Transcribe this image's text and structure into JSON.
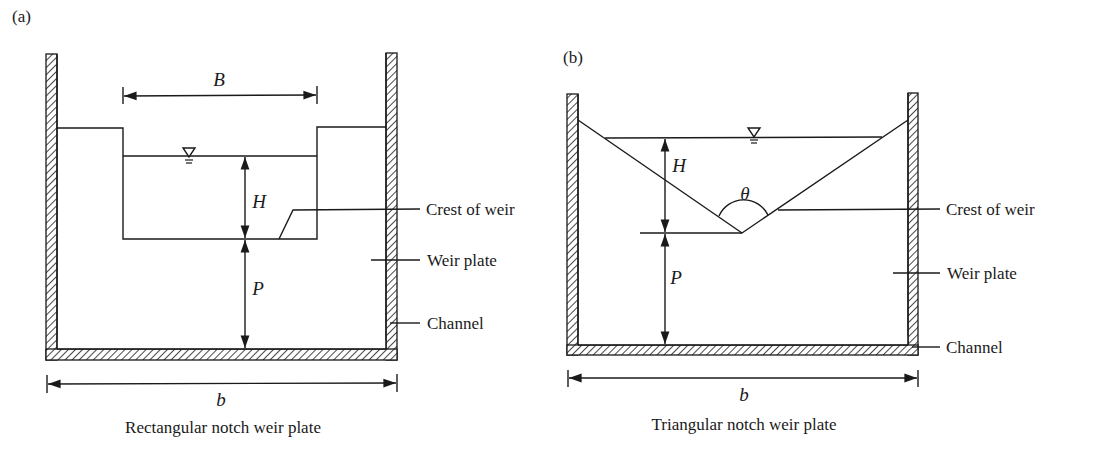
{
  "panels": [
    {
      "id": "a",
      "tag": "(a)",
      "caption": "Rectangular notch weir plate",
      "dimensions": {
        "notch_width": "B",
        "head": "H",
        "crest_height": "P",
        "channel_width": "b"
      },
      "callouts": {
        "crest": "Crest of weir",
        "plate": "Weir plate",
        "channel": "Channel"
      }
    },
    {
      "id": "b",
      "tag": "(b)",
      "caption": "Triangular notch weir plate",
      "dimensions": {
        "angle": "θ",
        "head": "H",
        "crest_height": "P",
        "channel_width": "b"
      },
      "callouts": {
        "crest": "Crest of weir",
        "plate": "Weir plate",
        "channel": "Channel"
      }
    }
  ],
  "symbols": {
    "water_surface": "water-surface-symbol"
  }
}
